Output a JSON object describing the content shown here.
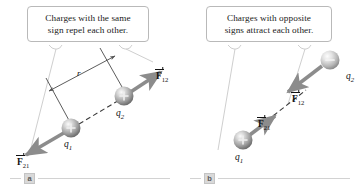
{
  "figure": {
    "panels": [
      {
        "letter": "a",
        "callout": {
          "line1": "Charges with the same",
          "line2": "sign repel each other."
        },
        "charges": [
          {
            "name": "q1",
            "label": "q",
            "subscript": "1",
            "sign": "+",
            "sign_glyph": "+"
          },
          {
            "name": "q2",
            "label": "q",
            "subscript": "2",
            "sign": "+",
            "sign_glyph": "+"
          }
        ],
        "force_labels": [
          {
            "name": "F12",
            "symbol": "F",
            "subscript": "12"
          },
          {
            "name": "F21",
            "symbol": "F",
            "subscript": "21"
          }
        ],
        "distance_label": "r"
      },
      {
        "letter": "b",
        "callout": {
          "line1": "Charges with opposite",
          "line2": "signs attract each other."
        },
        "charges": [
          {
            "name": "q1",
            "label": "q",
            "subscript": "1",
            "sign": "+",
            "sign_glyph": "+"
          },
          {
            "name": "q2",
            "label": "q",
            "subscript": "2",
            "sign": "-",
            "sign_glyph": "–"
          }
        ],
        "force_labels": [
          {
            "name": "F12",
            "symbol": "F",
            "subscript": "12"
          },
          {
            "name": "F21",
            "symbol": "F",
            "subscript": "21"
          }
        ],
        "distance_label": ""
      }
    ],
    "colors": {
      "arrow": "#8c8c8c",
      "sphere_light": "#f2f2f2",
      "sphere_mid": "#b5b5b5",
      "sphere_dark": "#6e6e6e",
      "callout_border": "#b9b9b9",
      "text": "#1a1a1a",
      "rule": "#d2d2d2",
      "leader": "#cfcfcf"
    }
  }
}
